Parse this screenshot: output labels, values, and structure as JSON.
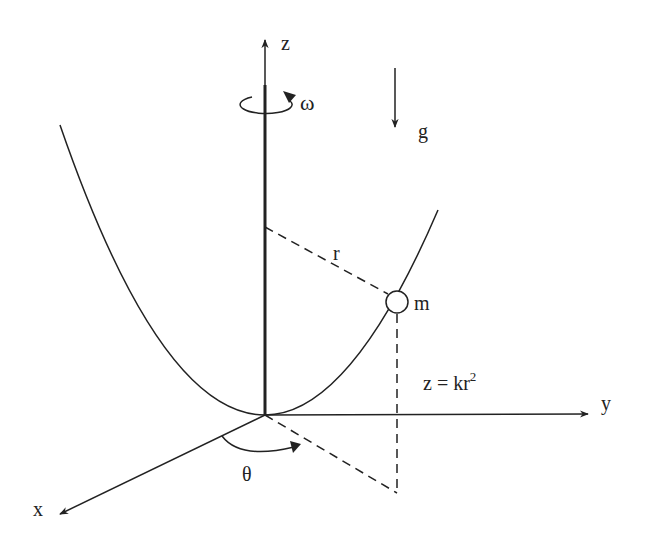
{
  "figure": {
    "colors": {
      "ink": "#222222",
      "background": "#ffffff"
    }
  },
  "labels": {
    "z_axis": "z",
    "y_axis": "y",
    "x_axis": "x",
    "omega": "ω",
    "gravity": "g",
    "radius": "r",
    "mass": "m",
    "theta": "θ",
    "equation_main": "z = kr",
    "equation_exponent": "2"
  },
  "elements": {
    "z_axis": {
      "from": [
        265,
        415
      ],
      "to": [
        265,
        38
      ]
    },
    "y_axis": {
      "from": [
        265,
        415
      ],
      "to": [
        588,
        414
      ]
    },
    "x_axis": {
      "from": [
        265,
        415
      ],
      "to": [
        58,
        515
      ]
    },
    "gravity_arrow": {
      "from": [
        395,
        68
      ],
      "to": [
        395,
        128
      ]
    },
    "mass_position": [
      397,
      302
    ],
    "mass_radius": 11,
    "parabola_vertex": [
      265,
      415
    ]
  }
}
